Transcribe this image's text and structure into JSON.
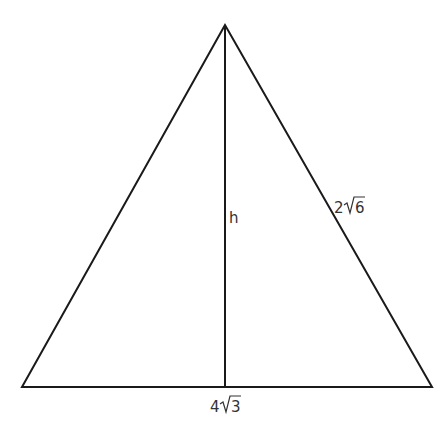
{
  "diagram": {
    "type": "isosceles-triangle-with-altitude",
    "stroke_color": "#1a1a1a",
    "label_color": "#333333",
    "labels": {
      "height": "h",
      "side": "2√6",
      "side_coef": "2",
      "side_radicand": "6",
      "base": "4√3",
      "base_coef": "4",
      "base_radicand": "3"
    }
  }
}
